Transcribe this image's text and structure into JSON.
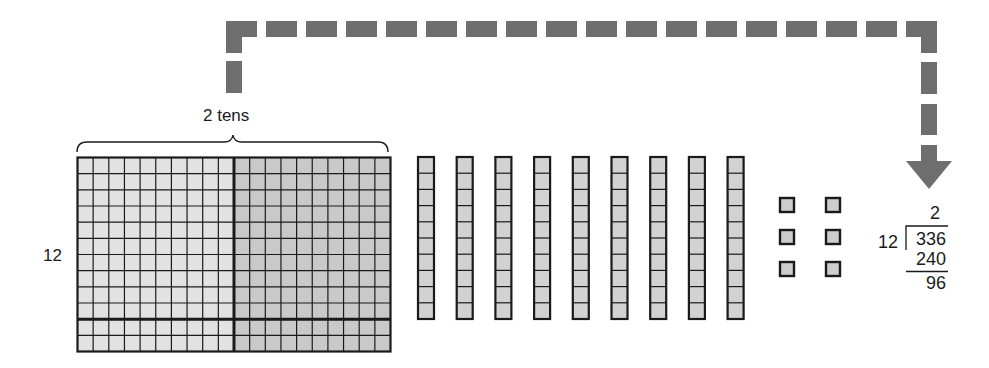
{
  "figure": {
    "colors": {
      "arrow": "#6e6e6e",
      "grid_left_fill": "#e2e2e2",
      "grid_right_fill": "#c9c9c9",
      "rod_fill": "#d2d2d2",
      "unit_fill": "#cdcdcd",
      "line": "#1a1a1a"
    }
  },
  "brace_label": "2 tens",
  "row_label": "12",
  "grid": {
    "columns": 20,
    "rows": 12,
    "divider_after_column": 10,
    "divider_after_row": 10,
    "description": "12 × 20 array representing 240"
  },
  "rods": {
    "count": 9,
    "cells_each": 10,
    "description": "9 tens rods"
  },
  "units": {
    "count": 6,
    "columns": 2,
    "rows": 3,
    "description": "6 unit cubes"
  },
  "arrow": {
    "style": "dashed",
    "direction": "from 2 tens brace to quotient",
    "icon": "arrow-down-icon"
  },
  "long_division": {
    "quotient": "2",
    "divisor": "12",
    "dividend": "336",
    "subtract": "240",
    "remainder": "96"
  }
}
